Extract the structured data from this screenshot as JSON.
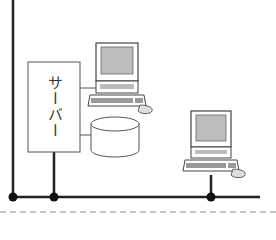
{
  "diagram": {
    "type": "network-topology",
    "server": {
      "label": "サーバー"
    },
    "nodes": [
      {
        "id": "server",
        "kind": "server-box",
        "label": "サーバー"
      },
      {
        "id": "pc1",
        "kind": "computer",
        "label": ""
      },
      {
        "id": "storage",
        "kind": "disk-storage",
        "label": ""
      },
      {
        "id": "pc2",
        "kind": "computer",
        "label": ""
      }
    ],
    "connections": [
      {
        "from": "server",
        "to": "pc1"
      },
      {
        "from": "server",
        "to": "storage"
      },
      {
        "from": "server",
        "to": "bus"
      },
      {
        "from": "pc2",
        "to": "bus"
      },
      {
        "from": "left-line",
        "to": "bus"
      }
    ],
    "colors": {
      "line": "#222222",
      "box": "#555555",
      "screen": "#bdbdbd"
    }
  }
}
